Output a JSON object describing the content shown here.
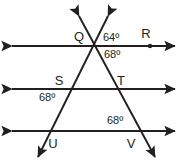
{
  "figure": {
    "type": "geometry-diagram",
    "stroke_color": "#231f20",
    "background_color": "#ffffff",
    "points": [
      {
        "id": "Q",
        "label": "Q",
        "x": 79,
        "y": 41,
        "dot": false
      },
      {
        "id": "R",
        "label": "R",
        "x": 146,
        "y": 38,
        "dot": true,
        "dot_x": 150,
        "dot_y": 46
      },
      {
        "id": "S",
        "label": "S",
        "x": 59,
        "y": 85,
        "dot": false
      },
      {
        "id": "T",
        "label": "T",
        "x": 121,
        "y": 85,
        "dot": false
      },
      {
        "id": "U",
        "label": "U",
        "x": 53,
        "y": 148,
        "dot": false
      },
      {
        "id": "V",
        "label": "V",
        "x": 131,
        "y": 148,
        "dot": false
      }
    ],
    "angles": [
      {
        "id": "angle-64-top",
        "value": "64º",
        "x": 103,
        "y": 41
      },
      {
        "id": "angle-68-below-q",
        "value": "68º",
        "x": 104,
        "y": 58
      },
      {
        "id": "angle-68-at-s",
        "value": "68º",
        "x": 39,
        "y": 101
      },
      {
        "id": "angle-68-at-v",
        "value": "68º",
        "x": 107,
        "y": 124
      }
    ],
    "parallel_lines": [
      {
        "id": "line-top",
        "y": 46,
        "x1": 12,
        "x2": 175
      },
      {
        "id": "line-middle",
        "y": 89,
        "x1": 12,
        "x2": 175
      },
      {
        "id": "line-bottom",
        "y": 131,
        "x1": 12,
        "x2": 175
      }
    ],
    "transversals": [
      {
        "id": "transversal-left",
        "x1": 108,
        "y1": 16,
        "x2": 38,
        "y2": 157
      },
      {
        "id": "transversal-right",
        "x1": 79,
        "y1": 16,
        "x2": 155,
        "y2": 157
      }
    ]
  }
}
